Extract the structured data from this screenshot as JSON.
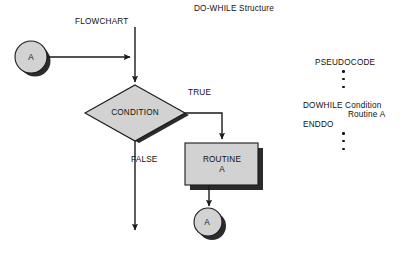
{
  "title": "DO-WHILE Structure",
  "sections": {
    "flowchart_heading": "FLOWCHART",
    "pseudocode_heading": "PSEUDOCODE"
  },
  "flowchart": {
    "connector_top": "A",
    "decision": "CONDITION",
    "branch_true": "TRUE",
    "branch_false": "FALSE",
    "process": "ROUTINE\nA",
    "connector_bottom": "A"
  },
  "pseudocode": {
    "dots_above": 3,
    "lines": [
      "DOWHILE Condition",
      "Routine A",
      "ENDDO"
    ],
    "line_dowhile": "DOWHILE Condition",
    "line_routine": "Routine A",
    "line_enddo": "ENDDO",
    "dots_below": 3
  },
  "colors": {
    "shape_fill": "#d2d2d2",
    "shape_stroke": "#1a1a1a",
    "shadow": "#2b2b2b",
    "line": "#1a1a1a",
    "text": "#111111",
    "background": "#ffffff"
  }
}
